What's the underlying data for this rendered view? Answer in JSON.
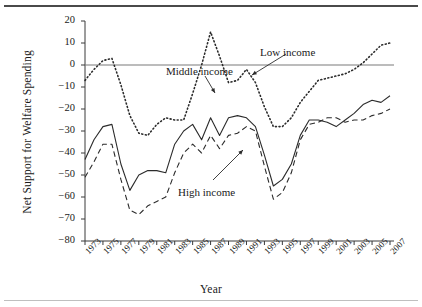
{
  "figure": {
    "rules": {
      "top": "top-rule",
      "bottom": "bottom-rule"
    }
  },
  "chart_data": {
    "type": "line",
    "title": "",
    "xlabel": "Year",
    "ylabel": "Net Support for Welfare Spending",
    "xlim": [
      1973,
      2007
    ],
    "ylim": [
      -80,
      20
    ],
    "yticks": [
      20,
      10,
      0,
      -10,
      -20,
      -30,
      -40,
      -50,
      -60,
      -70,
      -80
    ],
    "ytick_labels": [
      "20",
      "10",
      "0",
      "−10",
      "−20",
      "−30",
      "−40",
      "−50",
      "−60",
      "−70",
      "−80"
    ],
    "xticks": [
      1973,
      1975,
      1977,
      1979,
      1981,
      1983,
      1985,
      1987,
      1989,
      1991,
      1993,
      1995,
      1997,
      1999,
      2001,
      2003,
      2005,
      2007
    ],
    "xtick_labels": [
      "1973",
      "1975",
      "1977",
      "1979",
      "1981",
      "1983",
      "1985",
      "1987",
      "1989",
      "1991",
      "1993",
      "1995",
      "1997",
      "1999",
      "2001",
      "2003",
      "2005",
      "2007"
    ],
    "grid": false,
    "zero_line": true,
    "legend_position": "inline-annotations",
    "x": [
      1973,
      1974,
      1975,
      1976,
      1977,
      1978,
      1979,
      1980,
      1981,
      1982,
      1983,
      1984,
      1985,
      1986,
      1987,
      1988,
      1989,
      1990,
      1991,
      1992,
      1993,
      1994,
      1995,
      1996,
      1997,
      1998,
      1999,
      2000,
      2001,
      2002,
      2003,
      2004,
      2005,
      2006,
      2007
    ],
    "series": [
      {
        "name": "Low income",
        "style": "dotted",
        "color": "#2b2b2b",
        "values": [
          -7,
          -2,
          2,
          3,
          -9,
          -23,
          -31,
          -32,
          -27,
          -24,
          -25,
          -25,
          -13,
          0,
          15,
          4,
          -8,
          -7,
          -2,
          -8,
          -19,
          -28,
          -28,
          -24,
          -17,
          -12,
          -7,
          -6,
          -5,
          -4,
          -2,
          1,
          5,
          9,
          10
        ]
      },
      {
        "name": "Middle income",
        "style": "solid",
        "color": "#2b2b2b",
        "values": [
          -43,
          -34,
          -28,
          -27,
          -45,
          -57,
          -50,
          -48,
          -48,
          -49,
          -36,
          -30,
          -27,
          -34,
          -24,
          -32,
          -24,
          -23,
          -24,
          -28,
          -41,
          -55,
          -52,
          -45,
          -32,
          -25,
          -25,
          -26,
          -28,
          -25,
          -22,
          -18,
          -16,
          -17,
          -14
        ]
      },
      {
        "name": "High income",
        "style": "dashed",
        "color": "#2b2b2b",
        "values": [
          -51,
          -44,
          -36,
          -36,
          -52,
          -66,
          -68,
          -64,
          -62,
          -60,
          -49,
          -40,
          -36,
          -40,
          -32,
          -38,
          -32,
          -31,
          -28,
          -30,
          -46,
          -61,
          -58,
          -49,
          -34,
          -27,
          -26,
          -24,
          -24,
          -26,
          -25,
          -25,
          -23,
          -22,
          -20
        ]
      }
    ],
    "annotations": [
      {
        "text": "Low income",
        "x_px": 260,
        "y_px": 46
      },
      {
        "text": "Middle income",
        "x_px": 166,
        "y_px": 65
      },
      {
        "text": "High income",
        "x_px": 178,
        "y_px": 186
      }
    ]
  }
}
